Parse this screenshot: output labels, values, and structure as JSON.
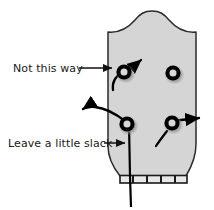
{
  "figure": {
    "width": 214,
    "height": 210
  },
  "colors": {
    "headstock_fill": "#d5d5d5",
    "headstock_outline": "#2b2b2b",
    "peg_color": "#000000",
    "peg_shadow": "#9a9a9a",
    "string_color": "#000000",
    "text_color": "#1a1a1a",
    "nut_fill": "#e8e8e8",
    "nut_outline": "#1a1a1a",
    "background": "#ffffff"
  },
  "labels": [
    {
      "id": "not-this-way",
      "text": "Not this way",
      "x": 13,
      "y": 72,
      "leader_from_x": 79,
      "leader_from_y": 68,
      "leader_to_x": 112,
      "leader_to_y": 68
    },
    {
      "id": "leave-a-little-slack",
      "text": "Leave a little slack",
      "x": 8,
      "y": 147,
      "leader_from_x": 104,
      "leader_from_y": 143,
      "leader_to_x": 131,
      "leader_to_y": 143
    }
  ],
  "pegs": [
    {
      "id": "peg-top-left",
      "cx": 124,
      "cy": 72,
      "r": 7.5,
      "has_string": true,
      "string_direction": "up-right"
    },
    {
      "id": "peg-top-right",
      "cx": 173,
      "cy": 73,
      "r": 7.5,
      "has_string": false,
      "string_direction": "none"
    },
    {
      "id": "peg-bottom-left",
      "cx": 127,
      "cy": 124,
      "r": 7.5,
      "has_string": true,
      "string_direction": "left-and-down"
    },
    {
      "id": "peg-bottom-right",
      "cx": 172,
      "cy": 123,
      "r": 7.5,
      "has_string": true,
      "string_direction": "right"
    }
  ],
  "strings": [
    {
      "id": "string-wrong-way",
      "description": "Curved string on upper-left peg pointing up and to the right, marked as incorrect"
    },
    {
      "id": "string-slack-left",
      "description": "Curved string from lower-left peg heading left with slack"
    },
    {
      "id": "string-through-nut",
      "description": "String running down from lower-left peg through the nut"
    },
    {
      "id": "string-right",
      "description": "String from lower-right peg heading right"
    },
    {
      "id": "string-stub-lower",
      "description": "Short diagonal string stub below lower-right peg"
    }
  ],
  "nut": {
    "id": "nut",
    "x": 123,
    "y": 176,
    "width": 60,
    "height": 7,
    "slot_count": 4
  }
}
